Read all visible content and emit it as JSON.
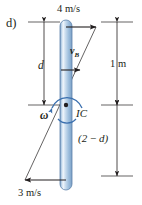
{
  "figure": {
    "part_label": "d)",
    "rod": {
      "description": "slender rod",
      "fill_color": "#a9c6e2",
      "edge_color": "#5b7fa6"
    },
    "labels": {
      "top_velocity": "4 m/s",
      "bottom_velocity": "3 m/s",
      "velocity_b": "v",
      "velocity_b_sub": "B",
      "distance_d": "d",
      "dimension_one_m": "1 m",
      "angular_velocity": "ω",
      "instant_center": "IC",
      "dimension_two_minus_d_open": "(2",
      "dimension_two_minus_d_op": " − ",
      "dimension_two_minus_d_close": "d)"
    },
    "colors": {
      "line": "#231f20",
      "rod_light": "#ffffff",
      "rod_mid": "#9dbedd",
      "rod_dark": "#5d82aa",
      "omega_arc": "#3a6fae",
      "background": "#ffffff"
    },
    "geometry": {
      "rod_top_y": 20,
      "rod_bottom_y": 190,
      "ic_y": 105,
      "rod_x": 66
    }
  }
}
